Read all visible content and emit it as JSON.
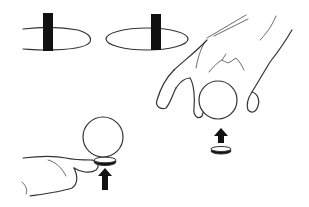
{
  "figure": {
    "panels": [
      {
        "id": "ellipse-left",
        "element": "open ellipse with black vertical bar"
      },
      {
        "id": "ellipse-right",
        "element": "closed ellipse with black vertical bar"
      },
      {
        "id": "hand-above-ball",
        "element": "hand gripping ball from above, coin and up arrow below"
      },
      {
        "id": "hand-below-ball",
        "element": "hand holding coin under ball, up arrow below coin"
      }
    ],
    "colors": {
      "line": "#333333",
      "fill": "#111111",
      "background": "#ffffff"
    }
  }
}
